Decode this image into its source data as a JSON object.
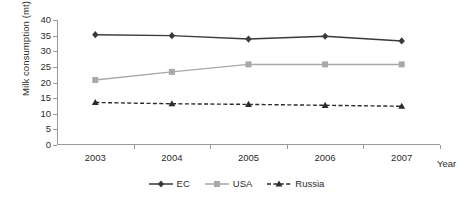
{
  "chart_data": {
    "type": "line",
    "title": "",
    "xlabel": "Year",
    "ylabel": "Milk consumption (mt)",
    "categories": [
      "2003",
      "2004",
      "2005",
      "2006",
      "2007"
    ],
    "ylim": [
      0,
      40
    ],
    "yticks": [
      0,
      5,
      10,
      15,
      20,
      25,
      30,
      35,
      40
    ],
    "grid": false,
    "legend_position": "bottom-center",
    "series": [
      {
        "name": "EC",
        "values": [
          35.3,
          35.0,
          33.9,
          34.8,
          33.3
        ],
        "color": "#3a3a3a",
        "marker": "diamond",
        "dash": "solid"
      },
      {
        "name": "USA",
        "values": [
          20.8,
          23.4,
          25.8,
          25.8,
          25.8
        ],
        "color": "#a8a8a8",
        "marker": "square",
        "dash": "solid"
      },
      {
        "name": "Russia",
        "values": [
          13.6,
          13.2,
          13.0,
          12.7,
          12.4
        ],
        "color": "#2b2b2b",
        "marker": "triangle",
        "dash": "dashed"
      }
    ]
  },
  "legend": {
    "items": [
      {
        "label": "EC"
      },
      {
        "label": "USA"
      },
      {
        "label": "Russia"
      }
    ]
  }
}
